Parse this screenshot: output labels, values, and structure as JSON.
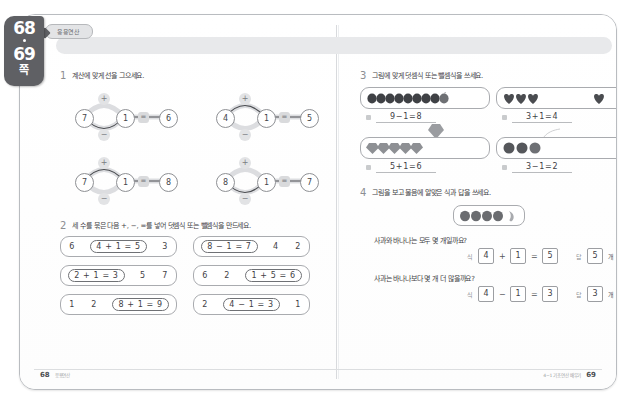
{
  "page_tab": {
    "page_left": "68",
    "page_right": "69",
    "unit_label": "쪽"
  },
  "header": {
    "chip_label": "응용연산"
  },
  "problems": {
    "p1": {
      "num": "1",
      "text": "계산에 맞게 선을 그으세요.",
      "diagrams": [
        {
          "left": "7",
          "mid": "1",
          "right": "6",
          "plus": "+",
          "minus": "−",
          "equals": "=",
          "selected": "minus"
        },
        {
          "left": "4",
          "mid": "1",
          "right": "5",
          "plus": "+",
          "minus": "−",
          "equals": "=",
          "selected": "plus"
        },
        {
          "left": "7",
          "mid": "1",
          "right": "8",
          "plus": "+",
          "minus": "−",
          "equals": "=",
          "selected": "plus"
        },
        {
          "left": "8",
          "mid": "1",
          "right": "7",
          "plus": "+",
          "minus": "−",
          "equals": "=",
          "selected": "minus"
        }
      ]
    },
    "p2": {
      "num": "2",
      "text": "세 수를 묶은 다음 +, −, =를 넣어 덧셈식 또는 뺄셈식을 만드세요.",
      "boxes": [
        {
          "pre": [
            "6"
          ],
          "group": "4 + 1 = 5",
          "post": [
            "3"
          ]
        },
        {
          "pre": [],
          "group": "8 − 1 = 7",
          "post": [
            "4",
            "2"
          ]
        },
        {
          "pre": [],
          "group": "2 + 1 = 3",
          "post": [
            "5",
            "7"
          ]
        },
        {
          "pre": [
            "6",
            "2"
          ],
          "group": "1 + 5 = 6",
          "post": []
        },
        {
          "pre": [
            "1",
            "2"
          ],
          "group": "8 + 1 = 9",
          "post": []
        },
        {
          "pre": [
            "2"
          ],
          "group": "4 − 1 = 3",
          "post": [
            "1"
          ]
        }
      ]
    },
    "p3": {
      "num": "3",
      "text": "그림에 맞게 덧셈식 또는 뺄셈식을 쓰세요.",
      "cells": [
        {
          "icon": "berry",
          "count": 9,
          "extra": 0,
          "away": 1,
          "equation": "9−1=8"
        },
        {
          "icon": "heart",
          "count": 3,
          "extra": 1,
          "away": 0,
          "equation": "3+1=4"
        },
        {
          "icon": "gem",
          "count": 5,
          "extra": 1,
          "away": 0,
          "equation": "5+1=6"
        },
        {
          "icon": "circle",
          "count": 3,
          "extra": 0,
          "away": 1,
          "equation": "3−1=2"
        }
      ]
    },
    "p4": {
      "num": "4",
      "text": "그림을 보고 물음에 알맞은 식과 답을 쓰세요.",
      "fruit": {
        "apples": 4,
        "bananas": 1
      },
      "questions": [
        {
          "text": "사과와 바나나는 모두 몇 개일까요?",
          "expr_label": "식",
          "ans_label": "답",
          "a": "4",
          "op": "+",
          "b": "1",
          "eq": "=",
          "result": "5",
          "answer": "5",
          "unit": "개"
        },
        {
          "text": "사과는 바나나보다 몇 개 더 많을까요?",
          "expr_label": "식",
          "ans_label": "답",
          "a": "4",
          "op": "−",
          "b": "1",
          "eq": "=",
          "result": "3",
          "answer": "3",
          "unit": "개"
        }
      ]
    }
  },
  "footer": {
    "left_page": "68",
    "left_text": "응용연산",
    "right_text": "4−1 기초연산 배우기",
    "right_page": "69"
  },
  "colors": {
    "tab_bg": "#5f6064",
    "band_bg": "#e8e9eb",
    "ink": "#3f4145",
    "rule": "#a9abaf"
  }
}
